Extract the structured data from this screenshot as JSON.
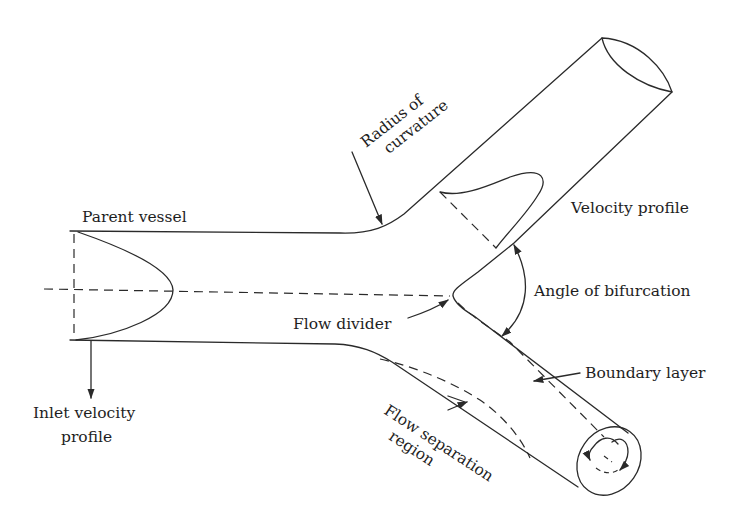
{
  "diagram": {
    "labels": {
      "parent_vessel": "Parent vessel",
      "radius_line1": "Radius of",
      "radius_line2": "curvature",
      "velocity_profile": "Velocity profile",
      "angle_of_bifurcation": "Angle of bifurcation",
      "flow_divider": "Flow divider",
      "boundary_layer": "Boundary layer",
      "flow_separation_line1": "Flow separation",
      "flow_separation_line2": "region",
      "inlet_line1": "Inlet velocity",
      "inlet_line2": "profile"
    },
    "colors": {
      "stroke": "#2a2a2a",
      "text": "#1e1e1e",
      "background": "#ffffff"
    }
  }
}
